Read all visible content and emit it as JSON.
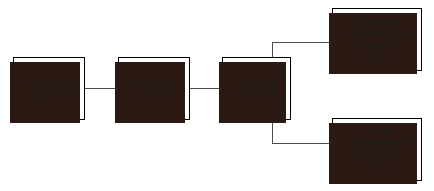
{
  "diagram": {
    "type": "flow-diagram",
    "background_color": "#ffffff",
    "box_border_color": "#000000",
    "box_fill_color": "#ffffff",
    "shadow_color": "#2b1a14",
    "connector_color": "#4d4d4d",
    "text_color": "#1a1a1a",
    "nodes": [
      {
        "id": "generation",
        "name": "Generation",
        "lines": [
          "Generation",
          "(262,030)"
        ],
        "label": "Generation",
        "value": "(262,030)"
      },
      {
        "id": "recovery",
        "name": "Recovery",
        "lines": [
          "Recovery",
          "(91,700)"
        ],
        "label": "Recovery",
        "value": "(91,700)"
      },
      {
        "id": "disposal",
        "name": "Disposal",
        "lines": [
          "Disposal",
          "(170,330)"
        ],
        "label": "Disposal",
        "value": "(170,330)"
      },
      {
        "id": "incineration",
        "name": "Incineration percentage of generation",
        "lines": [
          "Incineration",
          "percentage of",
          "generation",
          "(14.5)"
        ],
        "label_line_1": "Incineration",
        "label_line_2": "percentage of",
        "label_line_3": "generation",
        "value": "(14.5)"
      },
      {
        "id": "landfill",
        "name": "Landfill percentage of generation",
        "lines": [
          "Landfill",
          "percentage of",
          "generation",
          "(50.5)"
        ],
        "label_line_1": "Landfill",
        "label_line_2": "percentage of",
        "label_line_3": "generation",
        "value": "(50.5)"
      }
    ],
    "edges": [
      {
        "from": "generation",
        "to": "recovery",
        "style": "straight"
      },
      {
        "from": "recovery",
        "to": "disposal",
        "style": "straight"
      },
      {
        "from": "disposal",
        "to": "incineration",
        "style": "elbow-up"
      },
      {
        "from": "disposal",
        "to": "landfill",
        "style": "elbow-down"
      }
    ]
  }
}
